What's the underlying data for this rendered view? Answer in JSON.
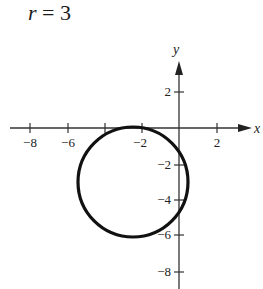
{
  "title": {
    "variable": "r",
    "equals": "=",
    "value": "3"
  },
  "axes": {
    "x_label": "x",
    "y_label": "y",
    "x_ticks": [
      {
        "value": -8,
        "label": "−8"
      },
      {
        "value": -6,
        "label": "−6"
      },
      {
        "value": -4,
        "label": ""
      },
      {
        "value": -2,
        "label": "−2"
      },
      {
        "value": 2,
        "label": "2"
      }
    ],
    "y_ticks": [
      {
        "value": 2,
        "label": "2"
      },
      {
        "value": -2,
        "label": "−2"
      },
      {
        "value": -4,
        "label": "−4"
      },
      {
        "value": -6,
        "label": "−6"
      },
      {
        "value": -8,
        "label": "−8"
      }
    ]
  },
  "curve": {
    "type": "circle",
    "center": [
      -2.5,
      -3
    ],
    "radius": 3,
    "stroke_color": "#111111"
  },
  "colors": {
    "axis": "#333333",
    "curve": "#111111",
    "background": "#ffffff"
  }
}
